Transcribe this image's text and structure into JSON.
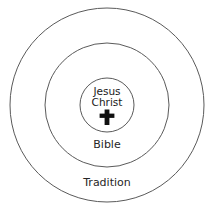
{
  "diagram": {
    "type": "concentric-circles",
    "background_color": "#ffffff",
    "stroke_color": "#5a5a5a",
    "text_color": "#262626",
    "center": {
      "x": 107,
      "y": 105
    },
    "rings": [
      {
        "id": "outer",
        "label": "Tradition",
        "radius": 97,
        "label_x": 107,
        "label_y": 183
      },
      {
        "id": "middle",
        "label": "Bible",
        "radius": 62,
        "label_x": 107,
        "label_y": 145
      },
      {
        "id": "inner",
        "label_line1": "Jesus",
        "label_line2": "Christ",
        "radius": 27,
        "label_x": 107,
        "label_line1_y": 92,
        "label_line2_y": 103,
        "icon": "cross-icon",
        "icon_x": 107,
        "icon_y": 117
      }
    ]
  }
}
